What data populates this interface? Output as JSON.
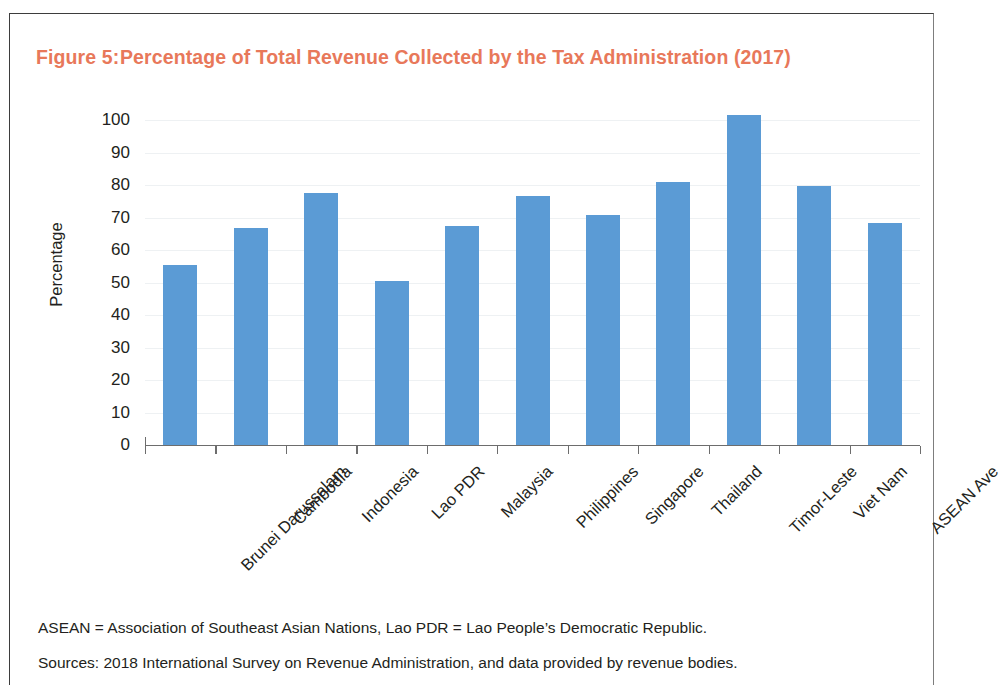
{
  "figure": {
    "number": "Figure 5:",
    "title": "Percentage of Total Revenue Collected by the Tax Administration (2017)",
    "title_color": "#E8785A"
  },
  "footnotes": {
    "abbreviations": "ASEAN = Association of Southeast Asian Nations, Lao PDR = Lao People’s Democratic Republic.",
    "sources": "Sources: 2018 International Survey on Revenue Administration, and data provided by revenue bodies."
  },
  "chart_data": {
    "type": "bar",
    "title": "Percentage of Total Revenue Collected by the Tax Administration (2017)",
    "xlabel": "",
    "ylabel": "Percentage",
    "ylim": [
      0,
      100
    ],
    "yticks": [
      0,
      10,
      20,
      30,
      40,
      50,
      60,
      70,
      80,
      90,
      100
    ],
    "ytick_labels": [
      "0",
      "10",
      "20",
      "30",
      "40",
      "50",
      "60",
      "70",
      "80",
      "90",
      "100"
    ],
    "grid": true,
    "legend": false,
    "bar_color": "#5B9BD5",
    "categories": [
      "Brunei Darussalam",
      "Cambodia",
      "Indonesia",
      "Lao PDR",
      "Malaysia",
      "Philippines",
      "Singapore",
      "Thailand",
      "Timor-Leste",
      "Viet Nam",
      "ASEAN Ave"
    ],
    "values": [
      55.4,
      66.8,
      77.5,
      50.5,
      67.4,
      76.6,
      70.8,
      80.9,
      101.5,
      79.7,
      68.3
    ]
  }
}
